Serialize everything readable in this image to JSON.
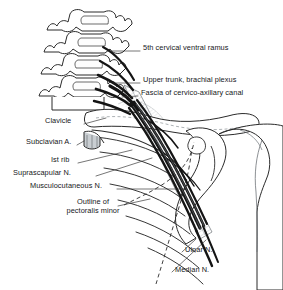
{
  "figure": {
    "background_color": "#ffffff",
    "ink_color": "#1a1a1a",
    "width": 283,
    "height": 290
  },
  "labels": [
    {
      "id": "c5-ramus",
      "text": "5th cervical ventral ramus",
      "x": 143,
      "y": 48,
      "align": "left"
    },
    {
      "id": "upper-trunk",
      "text": "Upper trunk, brachial plexus",
      "x": 143,
      "y": 80,
      "align": "left"
    },
    {
      "id": "fascia",
      "text": "Fascia of cervico-axillary canal",
      "x": 141,
      "y": 93,
      "align": "left"
    },
    {
      "id": "clavicle",
      "text": "Clavicle",
      "x": 45,
      "y": 121,
      "align": "left"
    },
    {
      "id": "subclavian-artery",
      "text": "Subclavian A.",
      "x": 26,
      "y": 142,
      "align": "left"
    },
    {
      "id": "first-rib",
      "text": "Ist rib",
      "x": 51,
      "y": 160,
      "align": "left"
    },
    {
      "id": "suprascapular",
      "text": "Suprascapular N.",
      "x": 13,
      "y": 173,
      "align": "left"
    },
    {
      "id": "musculocutaneous",
      "text": "Musculocutaneous N.",
      "x": 30,
      "y": 186,
      "align": "left"
    },
    {
      "id": "ulnar",
      "text": "Ulnar N.",
      "x": 185,
      "y": 250,
      "align": "left"
    },
    {
      "id": "median",
      "text": "Median N.",
      "x": 175,
      "y": 270,
      "align": "left"
    }
  ],
  "multiline_labels": [
    {
      "id": "pectoralis-minor",
      "line1": "Outline of",
      "line2": "pectoralis minor",
      "x": 50,
      "y": 203
    }
  ],
  "structures": [
    {
      "id": "cervical-vertebrae",
      "name": "cervical vertebrae stack",
      "count": 4
    },
    {
      "id": "clavicle-bone",
      "name": "clavicle"
    },
    {
      "id": "scapula-bone",
      "name": "scapula"
    },
    {
      "id": "humerus-bone",
      "name": "humerus head"
    },
    {
      "id": "rib-cage",
      "name": "rib cage arcs"
    },
    {
      "id": "nerve-bundle",
      "name": "brachial plexus nerve cords"
    },
    {
      "id": "fascia-sheath",
      "name": "cervico-axillary fascial sheath"
    },
    {
      "id": "pectoralis-outline",
      "name": "pectoralis minor dashed outline"
    }
  ]
}
